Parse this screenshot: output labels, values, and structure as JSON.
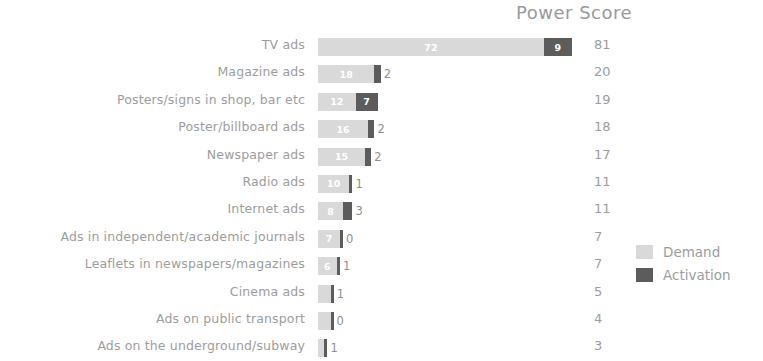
{
  "chart_data": {
    "type": "bar",
    "subtype": "stacked-horizontal",
    "title": "Power Score",
    "xlabel": "",
    "ylabel": "",
    "grid": false,
    "legend_position": "right-bottom",
    "value_label_suffix": "",
    "categories": [
      "TV ads",
      "Magazine ads",
      "Posters/signs in shop, bar etc",
      "Poster/billboard ads",
      "Newspaper ads",
      "Radio ads",
      "Internet ads",
      "Ads in independent/academic journals",
      "Leaflets in newspapers/magazines",
      "Cinema ads",
      "Ads on public transport",
      "Ads on the underground/subway"
    ],
    "series": [
      {
        "name": "Demand",
        "color": "#d9d9d9",
        "values": [
          72,
          18,
          12,
          16,
          15,
          10,
          8,
          7,
          6,
          4,
          4,
          2
        ]
      },
      {
        "name": "Activation",
        "color": "#5c5c5c",
        "values": [
          9,
          2,
          7,
          2,
          2,
          1,
          3,
          0,
          1,
          1,
          0,
          1
        ]
      }
    ],
    "totals": [
      81,
      20,
      19,
      18,
      17,
      11,
      11,
      7,
      7,
      5,
      4,
      3
    ],
    "total_column_header": "Power Score",
    "xlim": [
      0,
      81
    ]
  },
  "legend": {
    "items": [
      {
        "label": "Demand",
        "color": "#d9d9d9"
      },
      {
        "label": "Activation",
        "color": "#5c5c5c"
      }
    ]
  }
}
